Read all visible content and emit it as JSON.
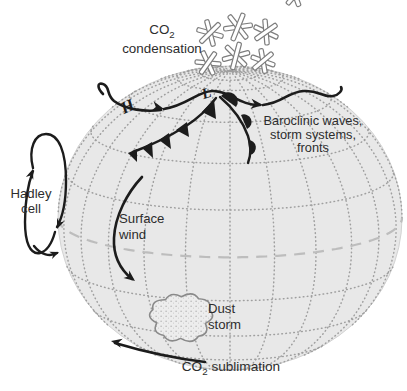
{
  "labels": {
    "co2_condensation": {
      "formula_main": "CO",
      "formula_sub": "2",
      "line2": "condensation"
    },
    "high_pressure": "H",
    "low_pressure": "L",
    "baroclinic": {
      "line1": "Baroclinic waves,",
      "line2": "storm systems,",
      "line3": "fronts"
    },
    "hadley": {
      "line1": "Hadley",
      "line2": "cell"
    },
    "surface_wind": {
      "line1": "Surface",
      "line2": "wind"
    },
    "dust_storm": {
      "line1": "Dust",
      "line2": "storm"
    },
    "co2_sublimation": {
      "formula_main": "CO",
      "formula_sub": "2",
      "rest": " sublimation"
    }
  },
  "icons": {
    "snowflake-icon": "six-arm outlined asterisk (CO2 ice crystal), 7 flakes above north pole",
    "jet-stream-arrow": "black wavy line with two arrowheads from H past L",
    "cold-front-symbol": "black line with 5 filled triangles pointing equatorward",
    "warm-front-symbol": "black line with 3 filled semicircle bumps",
    "hadley-cell-loop-arrow": "vertical circulation loop with up/down arrowheads",
    "surface-wind-arrow": "curved arrow bending toward lower right",
    "co2-sublimation-arrow": "arrow sweeping left along lower-left limb",
    "dust-storm-cloud": "scalloped speckled cloud blob",
    "globe-graticule": "dotted latitude/longitude grid on sphere",
    "equator-dashed-line": "long-dash gray equator arc"
  },
  "colors": {
    "background": "#ffffff",
    "globe_fill": "#e8e8e8",
    "globe_edge": "#d2d2d2",
    "graticule": "#9f9f9f",
    "equator": "#bdbdbd",
    "ink": "#1c1c1c",
    "text": "#2d2d2d",
    "cloud_fill": "#ededed",
    "cloud_edge": "#8a8a8a",
    "snowflake_fill": "#ffffff",
    "snowflake_edge": "#7d7d7d"
  }
}
